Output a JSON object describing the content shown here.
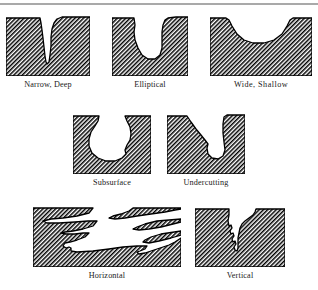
{
  "figure": {
    "background_color": "#ffffff",
    "line_color": "#000000",
    "hatch_color": "#000000",
    "rule_color": "#a9a9a9",
    "rows": [
      {
        "id": "row-1",
        "cells": [
          {
            "id": "narrow-deep",
            "label": "Narrow, Deep",
            "shape": "narrow-deep",
            "width": 84,
            "height": 62
          },
          {
            "id": "elliptical",
            "label": "Elliptical",
            "shape": "elliptical",
            "width": 76,
            "height": 62
          },
          {
            "id": "wide-shallow",
            "label": "Wide, Shallow",
            "shape": "wide-shallow",
            "width": 102,
            "height": 62
          }
        ]
      },
      {
        "id": "row-2",
        "cells": [
          {
            "id": "subsurface",
            "label": "Subsurface",
            "shape": "subsurface",
            "width": 78,
            "height": 62
          },
          {
            "id": "undercutting",
            "label": "Undercutting",
            "shape": "undercutting",
            "width": 78,
            "height": 62
          }
        ]
      },
      {
        "id": "row-3",
        "cells": [
          {
            "id": "horizontal",
            "label": "Horizontal",
            "shape": "horizontal",
            "width": 148,
            "height": 62
          },
          {
            "id": "vertical",
            "label": "Vertical",
            "shape": "vertical",
            "width": 90,
            "height": 62
          }
        ]
      }
    ]
  }
}
